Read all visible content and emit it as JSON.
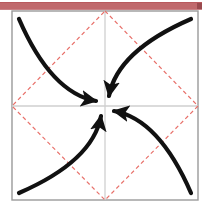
{
  "figure": {
    "frame": {
      "x": 12,
      "y": 11,
      "width": 186,
      "height": 189,
      "stroke": "#9a9a9a",
      "stroke_width": 1.4,
      "fill": "#ffffff"
    },
    "center": {
      "x": 105,
      "y": 106
    },
    "axes": {
      "stroke": "#cfcfcf",
      "stroke_width": 1.3,
      "horizontal": {
        "x1": 12,
        "y1": 106,
        "x2": 198,
        "y2": 106
      },
      "vertical": {
        "x1": 105,
        "y1": 11,
        "x2": 105,
        "y2": 200
      }
    },
    "diamond": {
      "stroke": "#e8706a",
      "stroke_width": 1.2,
      "dash": "4 3",
      "vertices": [
        {
          "x": 105,
          "y": 11
        },
        {
          "x": 198,
          "y": 106
        },
        {
          "x": 105,
          "y": 200
        },
        {
          "x": 12,
          "y": 106
        }
      ]
    },
    "curves": {
      "stroke": "#111111",
      "stroke_width": 4.2,
      "arrow_fill": "#111111",
      "items": [
        {
          "name": "trajectory-upper-left",
          "quadrant": "upper-left",
          "path": "M 19 19 C 42 72 68 96 96 101",
          "arrow": {
            "x": 98,
            "y": 101,
            "angle": 12
          }
        },
        {
          "name": "trajectory-upper-right",
          "quadrant": "upper-right",
          "path": "M 191 19 C 138 42 114 68 109 96",
          "arrow": {
            "x": 109,
            "y": 99,
            "angle": 102
          }
        },
        {
          "name": "trajectory-lower-right",
          "quadrant": "lower-right",
          "path": "M 191 193 C 168 140 142 116 114 111",
          "arrow": {
            "x": 112,
            "y": 111,
            "angle": 192
          }
        },
        {
          "name": "trajectory-lower-left",
          "quadrant": "lower-left",
          "path": "M 19 193 C 72 170 96 144 101 116",
          "arrow": {
            "x": 101,
            "y": 113,
            "angle": 282
          }
        }
      ]
    }
  },
  "top_bar": {
    "label": "title-bar",
    "color": "#c0696c",
    "endcap_color": "#9a4a4e"
  }
}
